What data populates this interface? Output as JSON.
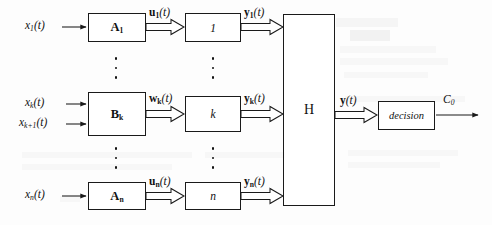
{
  "figure": {
    "type": "block-diagram"
  },
  "inputs": [
    {
      "id": "x1",
      "label_html": "x<sub>1</sub>(t)",
      "label": "x1(t)"
    },
    {
      "id": "xk",
      "label_html": "x<sub>k</sub>(t)",
      "label": "xk(t)"
    },
    {
      "id": "xk1",
      "label_html": "x<sub>k+1</sub>(t)",
      "label": "xk+1(t)"
    },
    {
      "id": "xn",
      "label_html": "x<sub>n</sub>(t)",
      "label": "xn(t)"
    }
  ],
  "stage1_blocks": [
    {
      "id": "A1",
      "label_html": "A<sub>1</sub>",
      "label": "A1"
    },
    {
      "id": "Bk",
      "label_html": "B<sub>k</sub>",
      "label": "Bk"
    },
    {
      "id": "An",
      "label_html": "A<sub>n</sub>",
      "label": "An"
    }
  ],
  "intermediate_signals": [
    {
      "id": "u1",
      "label_html": "u<sub>1</sub>(t)",
      "label": "u1(t)"
    },
    {
      "id": "wk",
      "label_html": "w<sub>k</sub>(t)",
      "label": "wk(t)"
    },
    {
      "id": "un",
      "label_html": "u<sub>n</sub>(t)",
      "label": "un(t)"
    }
  ],
  "stage2_blocks": [
    {
      "id": "one",
      "label_html": "1",
      "label": "1"
    },
    {
      "id": "kay",
      "label_html": "k",
      "label": "k"
    },
    {
      "id": "enn",
      "label_html": "n",
      "label": "n"
    }
  ],
  "stage2_outputs": [
    {
      "id": "y1",
      "label_html": "y<sub>1</sub>(t)",
      "label": "y1(t)"
    },
    {
      "id": "yk",
      "label_html": "y<sub>k</sub>(t)",
      "label": "yk(t)"
    },
    {
      "id": "yn",
      "label_html": "y<sub>n</sub>(t)",
      "label": "yn(t)"
    }
  ],
  "combiner": {
    "id": "H",
    "label_html": "H",
    "label": "H"
  },
  "combiner_output": {
    "id": "y",
    "label_html": "y(t)",
    "label": "y(t)"
  },
  "decision": {
    "id": "decision",
    "label_html": "decision",
    "label": "decision"
  },
  "final_output": {
    "id": "C0",
    "label_html": "C<sub>0</sub>",
    "label": "C0"
  },
  "ellipses": [
    {
      "id": "col1-upper"
    },
    {
      "id": "col1-lower"
    },
    {
      "id": "col2-upper"
    },
    {
      "id": "col2-lower"
    }
  ],
  "colors": {
    "stroke": "#1a1a1a",
    "text": "#111111",
    "background": "#fdfdfd"
  }
}
